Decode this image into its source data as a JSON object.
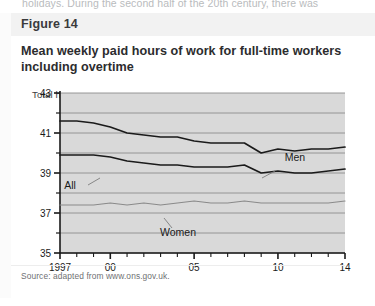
{
  "page": {
    "body_text_fragment": "holidays. During the second half of the 20th century, there was"
  },
  "figure": {
    "header_label": "Figure 14",
    "title": "Mean weekly paid hours of work for full-time workers including overtime",
    "source": "Source: adapted from www.ons.gov.uk."
  },
  "colors": {
    "plot_background": "#d9d9d9",
    "gridline": "#8d8d8d",
    "axis": "#1a1a1a",
    "men_line": "#1a1a1a",
    "all_line": "#1a1a1a",
    "women_line": "#8a8a8a",
    "header_background": "#f2f2f2",
    "title_text": "#2c2c2e"
  },
  "chart_data": {
    "type": "line",
    "title": "Mean weekly paid hours of work for full-time workers including overtime",
    "xlabel": "",
    "ylabel": "Total hours",
    "ylim": [
      35,
      43
    ],
    "xlim": [
      1997,
      2014
    ],
    "grid": true,
    "y_ticks": [
      35,
      36,
      37,
      38,
      39,
      40,
      41,
      42,
      43
    ],
    "y_tick_labels": [
      "35",
      "",
      "37",
      "",
      "39",
      "",
      "41",
      "",
      "43"
    ],
    "x": [
      1997,
      1998,
      1999,
      2000,
      2001,
      2002,
      2003,
      2004,
      2005,
      2006,
      2007,
      2008,
      2009,
      2010,
      2011,
      2012,
      2013,
      2014
    ],
    "x_tick_labels": [
      "1997",
      "",
      "",
      "00",
      "",
      "",
      "",
      "",
      "05",
      "",
      "",
      "",
      "",
      "10",
      "",
      "",
      "",
      "14"
    ],
    "legend_position": "inline-annotations",
    "series": [
      {
        "name": "Men",
        "color": "#1a1a1a",
        "label_position": "inline",
        "values": [
          41.6,
          41.6,
          41.5,
          41.3,
          41.0,
          40.9,
          40.8,
          40.8,
          40.6,
          40.5,
          40.5,
          40.5,
          40.0,
          40.2,
          40.1,
          40.2,
          40.2,
          40.3
        ]
      },
      {
        "name": "All",
        "color": "#1a1a1a",
        "label_position": "inline",
        "values": [
          39.9,
          39.9,
          39.9,
          39.8,
          39.6,
          39.5,
          39.4,
          39.4,
          39.3,
          39.3,
          39.3,
          39.4,
          39.0,
          39.1,
          39.0,
          39.0,
          39.1,
          39.2
        ]
      },
      {
        "name": "Women",
        "color": "#8a8a8a",
        "label_position": "inline",
        "values": [
          37.4,
          37.4,
          37.4,
          37.5,
          37.4,
          37.5,
          37.4,
          37.5,
          37.6,
          37.5,
          37.5,
          37.6,
          37.5,
          37.5,
          37.5,
          37.5,
          37.5,
          37.6
        ]
      }
    ],
    "annotations": [
      {
        "text": "Men",
        "series": "Men"
      },
      {
        "text": "All",
        "series": "All"
      },
      {
        "text": "Women",
        "series": "Women"
      }
    ]
  }
}
